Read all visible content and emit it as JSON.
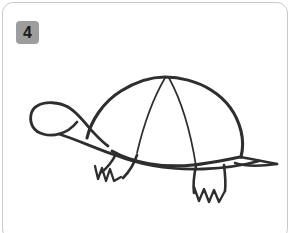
{
  "card": {
    "background_color": "#ffffff",
    "border_color": "#c9c9c9",
    "corner_radius_px": 11
  },
  "badge": {
    "label": "4",
    "background_color": "#9d9d9d",
    "text_color": "#1b1b1b",
    "shape": "rounded-square"
  },
  "illustration": {
    "subject": "turtle",
    "style": "hand-drawn line art",
    "stroke_color": "#2e2e2e",
    "fill_color": "#ffffff",
    "parts": [
      "shell-dome",
      "shell-division-line-left",
      "shell-division-line-right",
      "head",
      "neck",
      "body-underside",
      "front-leg",
      "front-foot-claws",
      "rear-leg",
      "rear-foot-claws",
      "tail"
    ]
  }
}
